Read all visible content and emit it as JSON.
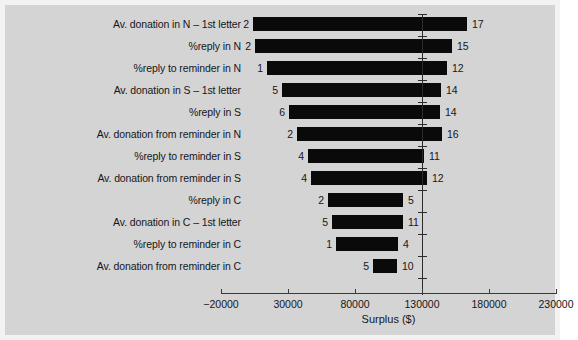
{
  "chart_data": {
    "type": "bar",
    "subtype": "tornado",
    "title": "",
    "xlabel": "Surplus ($)",
    "ylabel": "",
    "xlim": [
      -35000,
      245000
    ],
    "xticks": [
      -20000,
      30000,
      80000,
      130000,
      180000,
      230000
    ],
    "xticklabels": [
      "−20000",
      "30000",
      "80000",
      "130000",
      "180000",
      "230000"
    ],
    "grid": false,
    "legend": null,
    "baseline": 130000,
    "categories": [
      "Av. donation in N – 1st letter",
      "%reply in N",
      "%reply to reminder in N",
      "Av. donation in S – 1st letter",
      "%reply in S",
      "Av. donation from reminder in N",
      "%reply to reminder in S",
      "Av. donation from reminder in S",
      "%reply in C",
      "Av. donation in C – 1st letter",
      "%reply to reminder in C",
      "Av. donation from reminder in C"
    ],
    "low_labels": [
      "2",
      "2",
      "1",
      "5",
      "6",
      "2",
      "4",
      "4",
      "2",
      "5",
      "1",
      "5"
    ],
    "high_labels": [
      "17",
      "15",
      "12",
      "14",
      "14",
      "16",
      "11",
      "12",
      "5",
      "11",
      "4",
      "10"
    ],
    "low_values": [
      3800,
      6000,
      22000,
      36000,
      42000,
      48000,
      63000,
      67000,
      98000,
      103000,
      110000,
      118000
    ],
    "high_values": [
      163000,
      151000,
      144000,
      139000,
      137000,
      136000,
      131000,
      133000,
      134000,
      130000,
      128000,
      136000
    ],
    "bar_left_px": [
      248,
      250,
      262,
      277,
      284,
      292,
      303,
      306,
      323,
      327,
      331,
      368
    ],
    "bar_right_px": [
      462,
      447,
      442,
      436,
      435,
      437,
      419,
      422,
      398,
      398,
      393,
      392
    ]
  }
}
